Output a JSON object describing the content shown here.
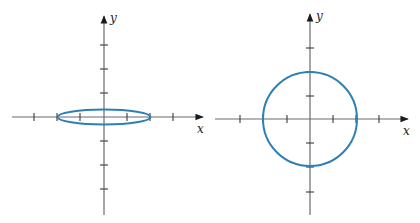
{
  "panels": [
    {
      "id": "left",
      "description": "Flattened ellipse centered at origin",
      "x_axis_label": "x",
      "y_axis_label": "y",
      "shape": "ellipse",
      "tick_spacing_units": 1,
      "x_ticks": [
        -3,
        -2,
        -1,
        1,
        2,
        3
      ],
      "y_ticks": [
        -3,
        -2,
        -1,
        1,
        2,
        3
      ],
      "semi_axis_x": 2,
      "semi_axis_y": 0.3
    },
    {
      "id": "right",
      "description": "Circle centered at origin",
      "x_axis_label": "x",
      "y_axis_label": "y",
      "shape": "circle",
      "tick_spacing_units": 1,
      "x_ticks": [
        -3,
        -2,
        -1,
        1,
        2,
        3
      ],
      "y_ticks": [
        -3,
        -2,
        -1,
        1,
        2,
        3
      ],
      "radius": 2
    }
  ],
  "colors": {
    "curve": "#2f7fb0",
    "axis": "#6b6b6b",
    "tick": "#3a3a3a",
    "background": "#ffffff"
  }
}
